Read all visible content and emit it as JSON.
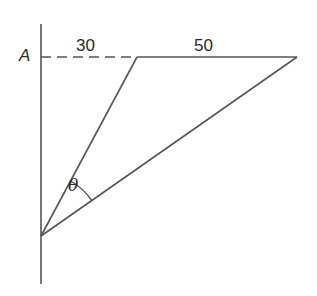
{
  "diagram": {
    "type": "geometry",
    "labels": {
      "point_A": "A",
      "segment_dashed": "30",
      "segment_solid": "50",
      "angle": "θ"
    },
    "colors": {
      "stroke": "#555555",
      "text": "#2a2a2a",
      "background": "#ffffff"
    }
  }
}
